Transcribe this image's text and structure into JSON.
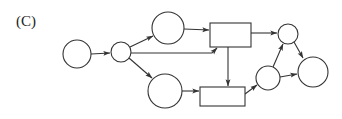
{
  "panel": {
    "label": "(C)"
  },
  "diagram": {
    "type": "petri-net",
    "colors": {
      "stroke": "#333333",
      "fill": "#ffffff",
      "background": "#ffffff"
    },
    "places": [
      {
        "id": "p1",
        "cx": 77,
        "cy": 54,
        "r": 14
      },
      {
        "id": "p2",
        "cx": 121,
        "cy": 52,
        "r": 10
      },
      {
        "id": "p3",
        "cx": 168,
        "cy": 28,
        "r": 16
      },
      {
        "id": "p4",
        "cx": 165,
        "cy": 91,
        "r": 17
      },
      {
        "id": "p5",
        "cx": 288,
        "cy": 34,
        "r": 10
      },
      {
        "id": "p6",
        "cx": 268,
        "cy": 78,
        "r": 12
      },
      {
        "id": "p7",
        "cx": 313,
        "cy": 72,
        "r": 15
      }
    ],
    "transitions": [
      {
        "id": "t1",
        "x": 210,
        "y": 23,
        "width": 41,
        "height": 24
      },
      {
        "id": "t2",
        "x": 200,
        "y": 87,
        "width": 45,
        "height": 19
      }
    ],
    "arcs": [
      {
        "from": "p1",
        "to": "p2"
      },
      {
        "from": "p2",
        "to": "p3"
      },
      {
        "from": "p2",
        "to": "p4"
      },
      {
        "from": "p2",
        "to": "t1"
      },
      {
        "from": "p3",
        "to": "t1"
      },
      {
        "from": "p4",
        "to": "t2"
      },
      {
        "from": "t1",
        "to": "t2"
      },
      {
        "from": "t1",
        "to": "p5"
      },
      {
        "from": "t2",
        "to": "p6"
      },
      {
        "from": "p6",
        "to": "p5"
      },
      {
        "from": "p6",
        "to": "p7"
      },
      {
        "from": "p5",
        "to": "p7"
      }
    ]
  }
}
